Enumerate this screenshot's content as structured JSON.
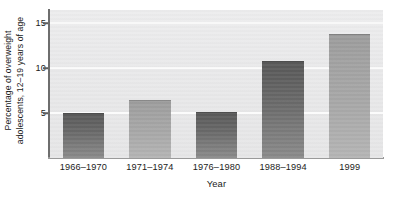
{
  "chart_data": {
    "type": "bar",
    "title": "",
    "categories": [
      "1966–1970",
      "1971–1974",
      "1976–1980",
      "1988–1994",
      "1999"
    ],
    "values": [
      5.0,
      6.5,
      5.1,
      10.8,
      13.8
    ],
    "xlabel": "Year",
    "ylabel_line1": "Percentage of overweight",
    "ylabel_line2": "adolescents, 12–19 years of age",
    "ylabel": "Percentage of overweight adolescents, 12–19 years of age",
    "ylim": [
      0,
      16.5
    ],
    "yticks": [
      5,
      10,
      15
    ],
    "ytick_labels": [
      "5",
      "10",
      "15"
    ],
    "grid": true,
    "gridlines_at": [
      5,
      10,
      15
    ],
    "legend": "none",
    "series": [
      {
        "name": "Percentage of overweight adolescents, 12-19 years of age",
        "values": [
          5.0,
          6.5,
          5.1,
          10.8,
          13.8
        ]
      }
    ],
    "bar_shades": [
      "dark",
      "light",
      "dark",
      "dark",
      "light"
    ],
    "colors": {
      "panel_background": "#e9e9ea",
      "gridline": "#fbfbfb",
      "bar_dark": "#6a6a6a",
      "bar_light": "#a7a7a7",
      "axis": "#6e6e6e",
      "text": "#1b1b1b"
    }
  }
}
